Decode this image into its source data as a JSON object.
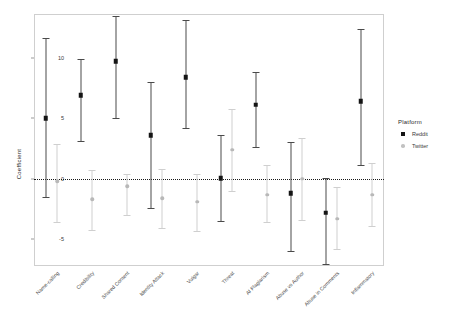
{
  "chart_data": {
    "type": "scatter",
    "title": "",
    "xlabel": "",
    "ylabel": "Coefficient",
    "ylim": [
      -7.2,
      13.6
    ],
    "yticks": [
      10,
      5,
      0,
      -5
    ],
    "ytick_labels": [
      "10",
      "5",
      "0",
      "-5"
    ],
    "grid": false,
    "zero_reference_line": 0,
    "legend": {
      "title": "Platform",
      "position": "right",
      "entries": [
        "Reddit",
        "Twitter"
      ]
    },
    "categories": [
      "Name-calling",
      "Credibility",
      "Shared Content",
      "Identity Attack",
      "Vulgar",
      "Threat",
      "AI Plagiarism",
      "Abuse vs Author",
      "Abuse in Comments",
      "Inflammatory"
    ],
    "series": [
      {
        "name": "Reddit",
        "color": "#141414",
        "values": [
          5.0,
          6.9,
          9.7,
          3.6,
          8.4,
          0.05,
          6.1,
          -1.2,
          -2.8,
          6.4
        ],
        "ci_lower": [
          -1.5,
          3.1,
          5.0,
          -2.4,
          4.2,
          -3.5,
          2.6,
          -6.0,
          -7.0,
          1.1
        ],
        "ci_upper": [
          11.6,
          9.9,
          13.4,
          8.0,
          13.1,
          3.6,
          8.8,
          3.0,
          0.1,
          12.4
        ]
      },
      {
        "name": "Twitter",
        "color": "#c2c2c2",
        "values": [
          -0.2,
          -1.7,
          -0.6,
          -1.6,
          -1.9,
          2.4,
          -1.3,
          0.0,
          -3.3,
          -1.3
        ],
        "ci_lower": [
          -3.6,
          -4.2,
          -3.0,
          -4.1,
          -4.3,
          -1.0,
          -3.6,
          -3.4,
          -5.8,
          -3.9
        ],
        "ci_upper": [
          2.9,
          0.7,
          0.4,
          0.8,
          0.4,
          5.8,
          1.1,
          3.4,
          -0.7,
          1.3
        ]
      }
    ]
  },
  "legend": {
    "title": "Platform",
    "reddit": "Reddit",
    "twitter": "Twitter"
  },
  "axis": {
    "y_title": "Coefficient"
  }
}
